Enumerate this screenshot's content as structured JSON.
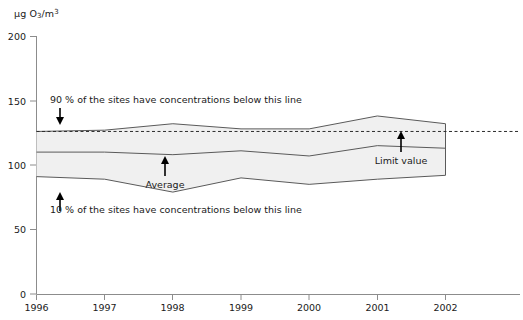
{
  "chart_data": {
    "type": "area",
    "title": "",
    "subtitle": "",
    "xlabel": "",
    "ylabel": "µg O3/m3",
    "ylabel_parts": {
      "prefix": "µg O",
      "sub": "3",
      "mid": "/m",
      "sup": "3"
    },
    "x": [
      1996,
      1997,
      1998,
      1999,
      2000,
      2001,
      2002
    ],
    "xtick_labels": [
      "1996",
      "1997",
      "1998",
      "1999",
      "2000",
      "2001",
      "2002"
    ],
    "ytick_labels": [
      "0",
      "50",
      "100",
      "150",
      "200"
    ],
    "yticks": [
      0,
      50,
      100,
      150,
      200
    ],
    "ylim": [
      0,
      200
    ],
    "xlim": [
      1996,
      2002
    ],
    "grid": false,
    "legend_position": "none",
    "series": [
      {
        "name": "90 % percentile",
        "values": [
          126,
          127,
          132,
          128,
          128,
          138,
          132
        ]
      },
      {
        "name": "Average",
        "values": [
          110,
          110,
          108,
          111,
          107,
          115,
          113
        ]
      },
      {
        "name": "10 % percentile",
        "values": [
          91,
          89,
          79,
          90,
          85,
          89,
          92
        ]
      }
    ],
    "band_fill_color": "#f0f0f0",
    "line_color": "#5a5a5a",
    "limit_value": {
      "name": "Limit value",
      "value": 126,
      "style": "dashed",
      "color": "#2b2b2b"
    },
    "annotations": [
      {
        "id": "upper-percentile-note",
        "text": "90 % of the sites have concentrations below this line",
        "arrow": "down"
      },
      {
        "id": "lower-percentile-note",
        "text": "10 % of the sites have concentrations below this line",
        "arrow": "up"
      },
      {
        "id": "average-note",
        "text": "Average",
        "arrow": "up"
      },
      {
        "id": "limit-value-note",
        "text": "Limit value",
        "arrow": "up"
      }
    ]
  }
}
